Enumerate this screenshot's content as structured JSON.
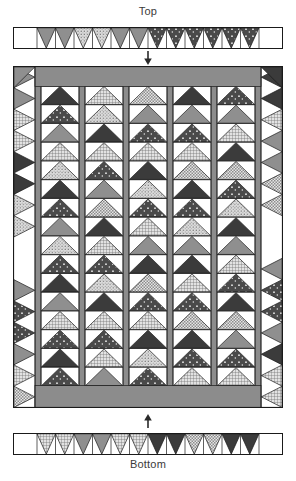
{
  "diagram": {
    "title_top": "Top",
    "title_bottom": "Bottom",
    "type": "quilt-assembly-diagram",
    "arrow_top_name": "down-arrow-icon",
    "arrow_bottom_name": "up-arrow-icon"
  },
  "colors": {
    "outline": "#1a1a1a",
    "background": "#ffffff",
    "sashing_gray": "#8c8c8c",
    "border_gray": "#8c8c8c",
    "dark": "#3b3b3b",
    "medium": "#8a8a8a",
    "light": "#d8d8d8",
    "white": "#ffffff",
    "text": "#3a3a3a"
  },
  "fabrics": {
    "dark_solid": {
      "name": "dark-solid",
      "fill": "#3b3b3b",
      "pattern": "none"
    },
    "dark_dot": {
      "name": "dark-dot",
      "fill": "#4a4a4a",
      "pattern": "dots-light"
    },
    "medium_solid": {
      "name": "medium-solid",
      "fill": "#8f8f8f",
      "pattern": "none"
    },
    "light_grid": {
      "name": "light-grid",
      "fill": "#e2e2e2",
      "pattern": "grid"
    },
    "light_dot": {
      "name": "light-dot",
      "fill": "#dcdcdc",
      "pattern": "dots-dark"
    },
    "light_check": {
      "name": "light-check",
      "fill": "#e6e6e6",
      "pattern": "check"
    }
  },
  "layout": {
    "strip_width": 270,
    "strip_height": 22,
    "body_width": 270,
    "body_height": 342,
    "geese_columns": 5,
    "geese_per_column": 16,
    "column_width": 38,
    "sashing_width": 12,
    "side_border_width": 22,
    "top_band_height": 20,
    "bottom_band_height": 22
  },
  "top_border": {
    "name": "top-border-strip",
    "left_plain_cells": 1,
    "right_plain_cells": 1,
    "units": [
      {
        "i": 0,
        "fabric": "medium_solid"
      },
      {
        "i": 1,
        "fabric": "medium_solid"
      },
      {
        "i": 2,
        "fabric": "light_dot"
      },
      {
        "i": 3,
        "fabric": "light_dot"
      },
      {
        "i": 4,
        "fabric": "medium_solid"
      },
      {
        "i": 5,
        "fabric": "medium_solid"
      },
      {
        "i": 6,
        "fabric": "dark_dot"
      },
      {
        "i": 7,
        "fabric": "dark_dot"
      },
      {
        "i": 8,
        "fabric": "dark_dot"
      },
      {
        "i": 9,
        "fabric": "dark_dot"
      },
      {
        "i": 10,
        "fabric": "dark_dot"
      },
      {
        "i": 11,
        "fabric": "dark_dot"
      }
    ]
  },
  "bottom_border": {
    "name": "bottom-border-strip",
    "left_plain_cells": 1,
    "right_plain_cells": 1,
    "units": [
      {
        "i": 0,
        "fabric": "light_grid"
      },
      {
        "i": 1,
        "fabric": "light_grid"
      },
      {
        "i": 2,
        "fabric": "medium_solid"
      },
      {
        "i": 3,
        "fabric": "medium_solid"
      },
      {
        "i": 4,
        "fabric": "light_grid"
      },
      {
        "i": 5,
        "fabric": "light_grid"
      },
      {
        "i": 6,
        "fabric": "dark_solid"
      },
      {
        "i": 7,
        "fabric": "dark_solid"
      },
      {
        "i": 8,
        "fabric": "light_check"
      },
      {
        "i": 9,
        "fabric": "light_check"
      },
      {
        "i": 10,
        "fabric": "dark_solid"
      },
      {
        "i": 11,
        "fabric": "dark_solid"
      }
    ]
  },
  "left_border": {
    "name": "left-border-strip",
    "units": [
      {
        "i": 0,
        "fabric": "medium_solid"
      },
      {
        "i": 1,
        "fabric": "medium_solid"
      },
      {
        "i": 2,
        "fabric": "light_grid"
      },
      {
        "i": 3,
        "fabric": "light_grid"
      },
      {
        "i": 4,
        "fabric": "dark_solid"
      },
      {
        "i": 5,
        "fabric": "dark_solid"
      },
      {
        "i": 6,
        "fabric": "light_dot"
      },
      {
        "i": 7,
        "fabric": "light_dot"
      },
      {
        "i": 8,
        "fabric": "white"
      },
      {
        "i": 9,
        "fabric": "white"
      },
      {
        "i": 10,
        "fabric": "medium_solid"
      },
      {
        "i": 11,
        "fabric": "dark_dot"
      },
      {
        "i": 12,
        "fabric": "dark_dot"
      },
      {
        "i": 13,
        "fabric": "medium_solid"
      },
      {
        "i": 14,
        "fabric": "light_grid"
      },
      {
        "i": 15,
        "fabric": "light_check"
      }
    ]
  },
  "right_border": {
    "name": "right-border-strip",
    "units": [
      {
        "i": 0,
        "fabric": "dark_solid"
      },
      {
        "i": 1,
        "fabric": "dark_solid"
      },
      {
        "i": 2,
        "fabric": "light_grid"
      },
      {
        "i": 3,
        "fabric": "medium_solid"
      },
      {
        "i": 4,
        "fabric": "medium_solid"
      },
      {
        "i": 5,
        "fabric": "light_check"
      },
      {
        "i": 6,
        "fabric": "light_check"
      },
      {
        "i": 7,
        "fabric": "white"
      },
      {
        "i": 8,
        "fabric": "white"
      },
      {
        "i": 9,
        "fabric": "medium_solid"
      },
      {
        "i": 10,
        "fabric": "dark_dot"
      },
      {
        "i": 11,
        "fabric": "dark_dot"
      },
      {
        "i": 12,
        "fabric": "medium_solid"
      },
      {
        "i": 13,
        "fabric": "dark_solid"
      },
      {
        "i": 14,
        "fabric": "light_grid"
      },
      {
        "i": 15,
        "fabric": "light_grid"
      }
    ]
  },
  "geese_columns": [
    {
      "name": "geese-column-1",
      "units": [
        "dark_solid",
        "dark_dot",
        "medium_solid",
        "light_grid",
        "light_dot",
        "dark_solid",
        "dark_dot",
        "medium_solid",
        "light_dot",
        "dark_dot",
        "dark_solid",
        "medium_solid",
        "light_grid",
        "dark_dot",
        "dark_solid",
        "dark_dot"
      ]
    },
    {
      "name": "geese-column-2",
      "units": [
        "light_grid",
        "light_dot",
        "dark_solid",
        "light_grid",
        "dark_dot",
        "medium_solid",
        "light_check",
        "dark_solid",
        "light_grid",
        "dark_dot",
        "light_dot",
        "dark_solid",
        "light_grid",
        "dark_dot",
        "light_grid",
        "medium_solid"
      ]
    },
    {
      "name": "geese-column-3",
      "units": [
        "light_check",
        "medium_solid",
        "dark_dot",
        "light_grid",
        "dark_solid",
        "light_dot",
        "dark_dot",
        "light_grid",
        "medium_solid",
        "dark_solid",
        "light_check",
        "dark_dot",
        "light_grid",
        "dark_solid",
        "light_dot",
        "dark_dot"
      ]
    },
    {
      "name": "geese-column-4",
      "units": [
        "dark_solid",
        "medium_solid",
        "dark_dot",
        "light_grid",
        "light_check",
        "dark_solid",
        "dark_dot",
        "light_dot",
        "medium_solid",
        "dark_solid",
        "light_grid",
        "dark_dot",
        "light_check",
        "dark_solid",
        "dark_dot",
        "light_grid"
      ]
    },
    {
      "name": "geese-column-5",
      "units": [
        "dark_dot",
        "medium_solid",
        "light_grid",
        "dark_solid",
        "light_check",
        "dark_dot",
        "light_dot",
        "dark_solid",
        "medium_solid",
        "light_grid",
        "dark_dot",
        "dark_solid",
        "light_check",
        "medium_solid",
        "dark_dot",
        "light_grid"
      ]
    }
  ]
}
